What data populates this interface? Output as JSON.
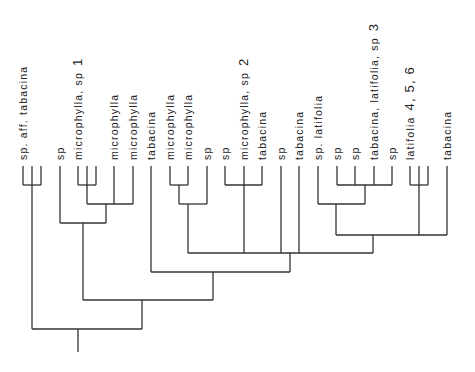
{
  "diagram": {
    "type": "dendrogram",
    "orientation": "root-bottom",
    "leaves": [
      {
        "id": "L1",
        "label": "sp. aff. tabacina",
        "group": "A"
      },
      {
        "id": "L1b",
        "label": "",
        "group": "A"
      },
      {
        "id": "L1c",
        "label": "",
        "group": "A"
      },
      {
        "id": "L2",
        "label": "sp"
      },
      {
        "id": "L3",
        "label": "microphylla, sp",
        "suffix": "1",
        "group": "B"
      },
      {
        "id": "L3b",
        "label": "",
        "group": "B"
      },
      {
        "id": "L3c",
        "label": "",
        "group": "B"
      },
      {
        "id": "L4",
        "label": "microphylla"
      },
      {
        "id": "L5",
        "label": "microphylla"
      },
      {
        "id": "L6",
        "label": "tabacina"
      },
      {
        "id": "L7",
        "label": "microphylla"
      },
      {
        "id": "L8",
        "label": "microphylla"
      },
      {
        "id": "L9",
        "label": "sp"
      },
      {
        "id": "L10",
        "label": "sp"
      },
      {
        "id": "L11",
        "label": "microphylla, sp",
        "suffix": "2"
      },
      {
        "id": "L12",
        "label": "tabacina"
      },
      {
        "id": "L13",
        "label": "sp"
      },
      {
        "id": "L14",
        "label": "tabacina"
      },
      {
        "id": "L15",
        "label": "sp. latifolia"
      },
      {
        "id": "L16",
        "label": "sp"
      },
      {
        "id": "L17",
        "label": "sp"
      },
      {
        "id": "L18",
        "label": "tabacina, latifolia, sp",
        "suffix": "3"
      },
      {
        "id": "L19",
        "label": "sp"
      },
      {
        "id": "L20",
        "label": "latifolia",
        "suffix": "4, 5, 6",
        "group": "C"
      },
      {
        "id": "L20b",
        "label": "",
        "group": "C"
      },
      {
        "id": "L20c",
        "label": "",
        "group": "C"
      },
      {
        "id": "L21",
        "label": "tabacina"
      }
    ],
    "tree": "((L1,L1b,L1c),((L2,((L3,L3b,L3c),L4,L5)),(L6,((((L7,L8),L9),(L10,L11,L12),L13,L14),(((L15,(L16,L17,L18,L19)),(L20,L20b,L20c),L21))))))"
  }
}
